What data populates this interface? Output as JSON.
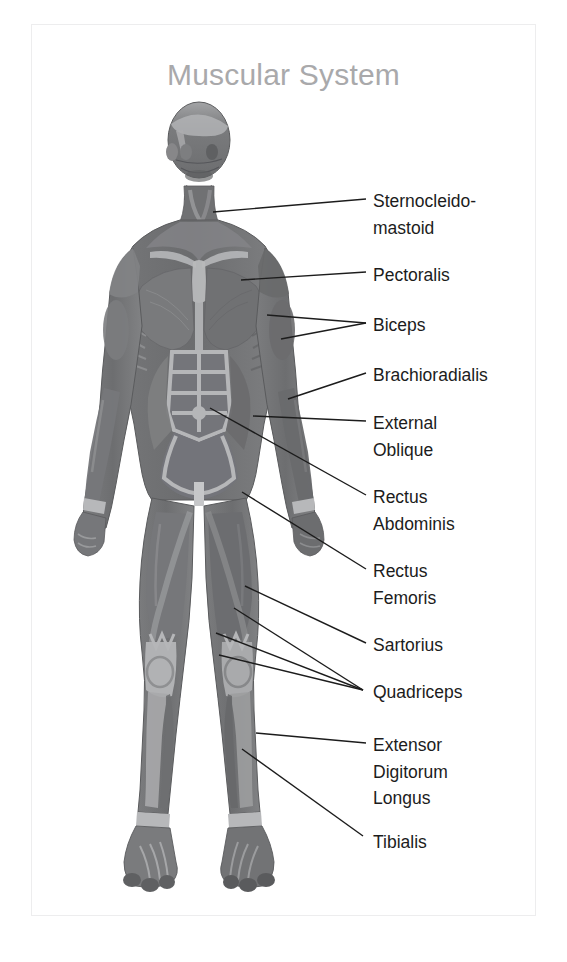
{
  "card": {
    "title": "Muscular System",
    "title_color": "#a9a9ab",
    "border_color": "#ededee",
    "background": "#ffffff"
  },
  "diagram": {
    "name": "muscular-system-anterior-view",
    "figure_description": "Anterior view of human body with superficial musculature, grayscale shading",
    "palette": {
      "muscle_dark": "#6e6f71",
      "muscle_mid": "#7c7d7f",
      "muscle_light": "#9a9b9d",
      "tendon": "#b9babc",
      "outline": "#5a5b5d",
      "leader_line": "#1c1c1c"
    }
  },
  "labels": [
    {
      "id": "sternocleidomastoid",
      "lines": [
        "Sternocleido-",
        "mastoid"
      ],
      "x": 373,
      "y": 188,
      "leaders": [
        {
          "x1": 213,
          "y1": 212,
          "x2": 366,
          "y2": 199
        }
      ]
    },
    {
      "id": "pectoralis",
      "lines": [
        "Pectoralis"
      ],
      "x": 373,
      "y": 262,
      "leaders": [
        {
          "x1": 241,
          "y1": 280,
          "x2": 366,
          "y2": 272
        }
      ]
    },
    {
      "id": "biceps",
      "lines": [
        "Biceps"
      ],
      "x": 373,
      "y": 312,
      "leaders": [
        {
          "x1": 267,
          "y1": 315,
          "x2": 366,
          "y2": 323
        },
        {
          "x1": 281,
          "y1": 339,
          "x2": 366,
          "y2": 323
        }
      ]
    },
    {
      "id": "brachioradialis",
      "lines": [
        "Brachioradialis"
      ],
      "x": 373,
      "y": 362,
      "leaders": [
        {
          "x1": 288,
          "y1": 399,
          "x2": 366,
          "y2": 373
        }
      ]
    },
    {
      "id": "external-oblique",
      "lines": [
        "External",
        "Oblique"
      ],
      "x": 373,
      "y": 410,
      "leaders": [
        {
          "x1": 253,
          "y1": 416,
          "x2": 366,
          "y2": 421
        }
      ]
    },
    {
      "id": "rectus-abdominis",
      "lines": [
        "Rectus",
        "Abdominis"
      ],
      "x": 373,
      "y": 484,
      "leaders": [
        {
          "x1": 210,
          "y1": 408,
          "x2": 366,
          "y2": 495
        }
      ]
    },
    {
      "id": "rectus-femoris",
      "lines": [
        "Rectus",
        "Femoris"
      ],
      "x": 373,
      "y": 558,
      "leaders": [
        {
          "x1": 242,
          "y1": 492,
          "x2": 366,
          "y2": 569
        }
      ]
    },
    {
      "id": "sartorius",
      "lines": [
        "Sartorius"
      ],
      "x": 373,
      "y": 632,
      "leaders": [
        {
          "x1": 245,
          "y1": 586,
          "x2": 366,
          "y2": 643
        }
      ]
    },
    {
      "id": "quadriceps",
      "lines": [
        "Quadriceps"
      ],
      "x": 373,
      "y": 679,
      "leaders": [
        {
          "x1": 216,
          "y1": 633,
          "x2": 363,
          "y2": 690
        },
        {
          "x1": 234,
          "y1": 608,
          "x2": 363,
          "y2": 690
        },
        {
          "x1": 219,
          "y1": 655,
          "x2": 363,
          "y2": 690
        }
      ]
    },
    {
      "id": "extensor-digitorum-longus",
      "lines": [
        "Extensor",
        "Digitorum",
        "Longus"
      ],
      "x": 373,
      "y": 732,
      "leaders": [
        {
          "x1": 256,
          "y1": 733,
          "x2": 366,
          "y2": 743
        }
      ]
    },
    {
      "id": "tibialis",
      "lines": [
        "Tibialis"
      ],
      "x": 373,
      "y": 829,
      "leaders": [
        {
          "x1": 242,
          "y1": 749,
          "x2": 363,
          "y2": 836
        }
      ]
    }
  ]
}
